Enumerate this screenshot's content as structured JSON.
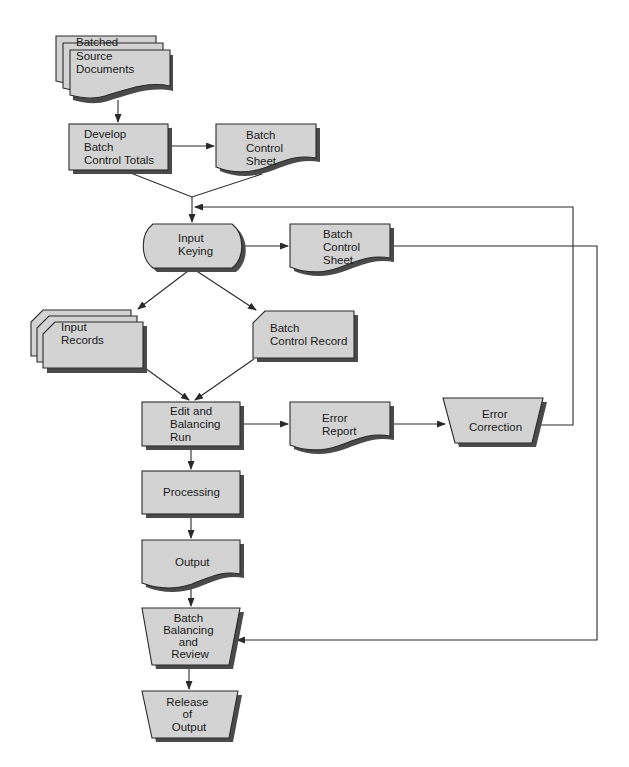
{
  "diagram": {
    "type": "flowchart",
    "colors": {
      "shape_fill": "#d3d3d3",
      "shadow": "#4a4a4a",
      "stroke": "#2a2a2a",
      "background": "#ffffff"
    },
    "nodes": {
      "batched_source": {
        "shape": "multi-document",
        "lines": [
          "Batched",
          "Source",
          "Documents"
        ]
      },
      "develop_totals": {
        "shape": "process",
        "lines": [
          "Develop",
          "Batch",
          "Control Totals"
        ]
      },
      "control_sheet_1": {
        "shape": "document",
        "lines": [
          "Batch",
          "Control",
          "Sheet"
        ]
      },
      "input_keying": {
        "shape": "manual-input-terminal",
        "lines": [
          "Input",
          "Keying"
        ]
      },
      "control_sheet_2": {
        "shape": "document",
        "lines": [
          "Batch",
          "Control",
          "Sheet"
        ]
      },
      "input_records": {
        "shape": "stacked-cards",
        "lines": [
          "Input",
          "Records"
        ]
      },
      "control_record": {
        "shape": "card",
        "lines": [
          "Batch",
          "Control Record"
        ]
      },
      "edit_run": {
        "shape": "process",
        "lines": [
          "Edit and",
          "Balancing",
          "Run"
        ]
      },
      "error_report": {
        "shape": "document",
        "lines": [
          "Error",
          "Report"
        ]
      },
      "error_correction": {
        "shape": "manual-operation",
        "lines": [
          "Error",
          "Correction"
        ]
      },
      "processing": {
        "shape": "process",
        "lines": [
          "Processing"
        ]
      },
      "output": {
        "shape": "document",
        "lines": [
          "Output"
        ]
      },
      "batch_balancing": {
        "shape": "manual-operation",
        "lines": [
          "Batch",
          "Balancing",
          "and",
          "Review"
        ]
      },
      "release_output": {
        "shape": "manual-operation",
        "lines": [
          "Release",
          "of",
          "Output"
        ]
      }
    },
    "edges": [
      {
        "from": "Batched Source Documents",
        "to": "Develop Batch Control Totals"
      },
      {
        "from": "Develop Batch Control Totals",
        "to": "Batch Control Sheet"
      },
      {
        "from": "Develop Batch Control Totals + Batch Control Sheet",
        "to": "Input Keying"
      },
      {
        "from": "Input Keying",
        "to": "Batch Control Sheet"
      },
      {
        "from": "Input Keying",
        "to": "Input Records"
      },
      {
        "from": "Input Keying",
        "to": "Batch Control Record"
      },
      {
        "from": "Input Records",
        "to": "Edit and Balancing Run"
      },
      {
        "from": "Batch Control Record",
        "to": "Edit and Balancing Run"
      },
      {
        "from": "Edit and Balancing Run",
        "to": "Error Report"
      },
      {
        "from": "Error Report",
        "to": "Error Correction"
      },
      {
        "from": "Error Correction",
        "to": "Input Keying"
      },
      {
        "from": "Edit and Balancing Run",
        "to": "Processing"
      },
      {
        "from": "Processing",
        "to": "Output"
      },
      {
        "from": "Output",
        "to": "Batch Balancing and Review"
      },
      {
        "from": "Batch Control Sheet",
        "to": "Batch Balancing and Review"
      },
      {
        "from": "Batch Balancing and Review",
        "to": "Release of Output"
      }
    ]
  }
}
